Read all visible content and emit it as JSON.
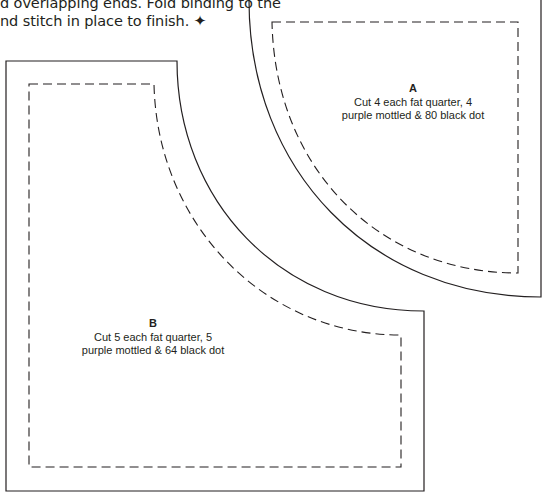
{
  "instructions": {
    "line1": "d overlapping ends. Fold binding to the",
    "line2": "nd stitch in place to finish.",
    "end_mark": "✦"
  },
  "templates": [
    {
      "id": "A",
      "letter": "A",
      "line1": "Cut 4 each fat quarter, 4",
      "line2": "purple mottled & 80 black dot"
    },
    {
      "id": "B",
      "letter": "B",
      "line1": "Cut 5 each fat quarter, 5",
      "line2": "purple mottled & 64 black dot"
    }
  ],
  "colors": {
    "line": "#231f20",
    "background": "#ffffff"
  }
}
